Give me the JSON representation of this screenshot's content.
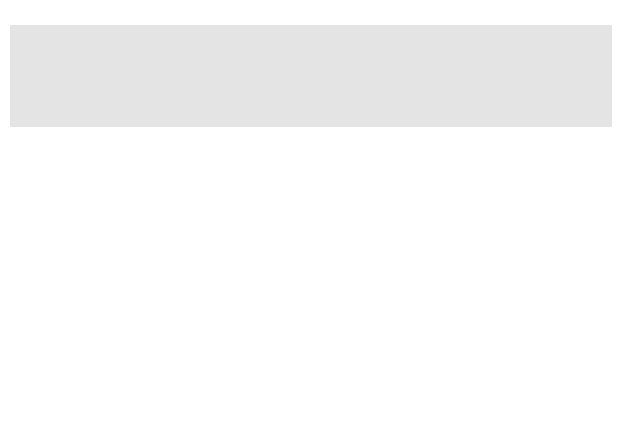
{
  "map": {
    "colors": {
      "background": "#e7e7e7",
      "land_unclaimed": "#f2f2f2",
      "free": "#9b9b9b",
      "free_by_compromise": "#b8b8b8",
      "slave": "#8a8a8a",
      "slave_by_compromise": "#c4c4c4",
      "water": "#e2e2e2",
      "lake": "#d9d9d9"
    },
    "regions": {
      "british_north_america": "BRITISH NORTH AMERICA",
      "oregon_country": "OREGON COUNTRY",
      "oregon_note_1": "(Joint U.S.-British",
      "oregon_note_2": "occupation)",
      "unorganized_territory": "UNORGANIZED TERRITORY",
      "spanish_territory": "SPANISH TERRITORY",
      "arkansas_1": "ARKANSAS",
      "arkansas_2": "TERRITORY",
      "michigan_1": "MICHIGAN",
      "michigan_2": "TERR.",
      "florida_1": "FLORIDA",
      "florida_2": "TERRITORY",
      "florida_note": "(Annexed 1819-1821)"
    },
    "states": {
      "maine": "MAINE",
      "maine_year": "(1820)",
      "vt": "VT.",
      "nh": "N.H.",
      "mass": "MASS.",
      "ri": "R.I.",
      "conn": "CONN.",
      "ny": "N.Y.",
      "nj": "N.J.",
      "pa": "PA.",
      "del": "DEL.",
      "md": "MD.",
      "ohio": "OHIO",
      "ind": "IND.",
      "ill": "ILL.",
      "mo": "MO.",
      "mo_year": "(1821)",
      "ky": "KY.",
      "va": "VA.",
      "nc": "N.C.",
      "tenn": "TENN.",
      "sc": "S.C.",
      "ga": "GA.",
      "ala": "ALA.",
      "miss": "MISS.",
      "la": "LA."
    },
    "lines": {
      "ceded_to_gb": "Ceded to Great Britain, 1818",
      "ceded_by_gb": "Ceded by Great Britain, 1818",
      "adams_onis": "Adams-Onis Treaty Line, 1819",
      "missouri_compromise": "Missouri Compromise Line",
      "latitude": "36°30'"
    },
    "water": {
      "pacific_1": "PACIFIC",
      "pacific_2": "OCEAN",
      "atlantic_1": "ATLANTIC",
      "atlantic_2": "OCEAN",
      "gulf": "Gulf of Mexico",
      "superior": "L. Superior",
      "michigan": "L. Michigan",
      "huron": "L. Huron",
      "erie": "L. Erie",
      "ontario": "L. Ontario"
    },
    "scale": {
      "miles_0": "0",
      "miles_250": "250",
      "miles_500": "500 miles",
      "km_0": "0",
      "km_250": "250",
      "km_500": "500 kilometers"
    }
  },
  "legend": {
    "items": [
      {
        "label": "Free states and territories",
        "color": "#9b9b9b"
      },
      {
        "label": "Free territory by Missouri Compromioc",
        "color": "#b8b8b8"
      },
      {
        "label": "Slave states and territories",
        "color": "#8a8a8a"
      },
      {
        "label": "Slave territory by Missouri Compromise",
        "color": "#c4c4c4"
      }
    ]
  }
}
